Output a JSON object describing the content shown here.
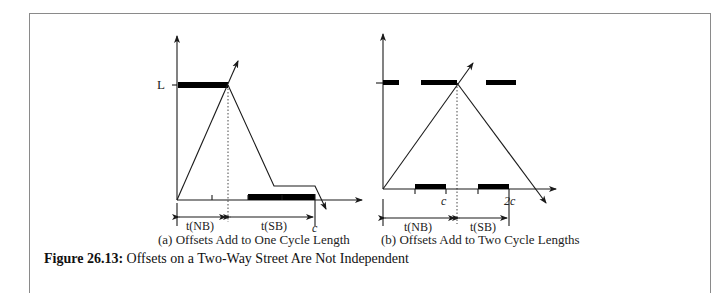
{
  "figure": {
    "number_label": "Figure 26.13:",
    "title": "Offsets on a Two-Way Street Are Not Independent"
  },
  "panel_a": {
    "caption": "(a) Offsets Add to One Cycle Length",
    "y_level_label": "L",
    "t_nb_label": "t(NB)",
    "t_sb_label": "t(SB)",
    "cycle_label": "c"
  },
  "panel_b": {
    "caption": "(b) Offsets Add to Two Cycle Lengths",
    "t_nb_label": "t(NB)",
    "t_sb_label": "t(SB)",
    "cycle_label": "c",
    "two_cycle_label": "2c"
  },
  "colors": {
    "line": "#1a1a1a",
    "bar": "#000000",
    "frame": "#8a8a8a"
  }
}
